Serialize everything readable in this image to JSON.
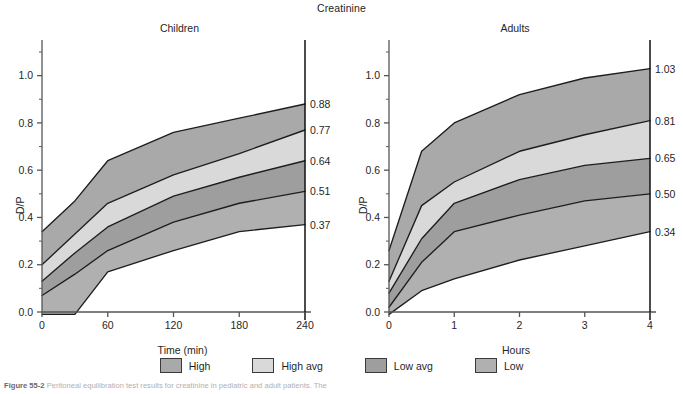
{
  "figure": {
    "title": "Creatinine",
    "caption_prefix": "Figure 55-2",
    "caption_text": "Peritoneal equilibration test results for creatinine in pediatric and adult patients. The"
  },
  "legend": {
    "items": [
      {
        "label": "High",
        "color": "#a9a9a9"
      },
      {
        "label": "High avg",
        "color": "#d9d9d9"
      },
      {
        "label": "Low avg",
        "color": "#9e9e9e"
      },
      {
        "label": "Low",
        "color": "#b0b0b0"
      }
    ]
  },
  "chart_data": [
    {
      "type": "area",
      "title": "Children",
      "xlabel": "Time (min)",
      "ylabel": "D/P",
      "xlim": [
        0,
        240
      ],
      "ylim": [
        -0.02,
        1.1
      ],
      "xticks": [
        0,
        60,
        120,
        180,
        240
      ],
      "xticklabels": [
        "0",
        "60",
        "120",
        "180",
        "240"
      ],
      "yticks": [
        0.0,
        0.2,
        0.4,
        0.6,
        0.8,
        1.0
      ],
      "yticklabels": [
        "0.0",
        "0.2",
        "0.4",
        "0.6",
        "0.8",
        "1.0"
      ],
      "yminorticks": [
        0.1,
        0.3,
        0.5,
        0.7,
        0.9,
        1.1
      ],
      "grid": false,
      "legend_position": "bottom",
      "x": [
        0,
        30,
        60,
        120,
        180,
        240
      ],
      "series": [
        {
          "name": "High boundary",
          "values": [
            0.34,
            0.47,
            0.64,
            0.76,
            0.82,
            0.88
          ]
        },
        {
          "name": "High avg boundary",
          "values": [
            0.2,
            0.33,
            0.46,
            0.58,
            0.67,
            0.77
          ]
        },
        {
          "name": "mid boundary",
          "values": [
            0.13,
            0.25,
            0.36,
            0.49,
            0.57,
            0.64
          ]
        },
        {
          "name": "Low avg boundary",
          "values": [
            0.07,
            0.16,
            0.26,
            0.38,
            0.46,
            0.51
          ]
        },
        {
          "name": "Low boundary",
          "values": [
            -0.01,
            -0.01,
            0.17,
            0.26,
            0.34,
            0.37
          ]
        }
      ],
      "bands": [
        {
          "label": "High",
          "upper": "High boundary",
          "lower": "High avg boundary",
          "color": "#a9a9a9"
        },
        {
          "label": "High avg",
          "upper": "High avg boundary",
          "lower": "mid boundary",
          "color": "#d9d9d9"
        },
        {
          "label": "Low avg",
          "upper": "mid boundary",
          "lower": "Low avg boundary",
          "color": "#9e9e9e"
        },
        {
          "label": "Low",
          "upper": "Low avg boundary",
          "lower": "Low boundary",
          "color": "#b0b0b0"
        }
      ],
      "endpoint_labels": [
        "0.88",
        "0.77",
        "0.64",
        "0.51",
        "0.37"
      ],
      "endpoint_values": [
        0.88,
        0.77,
        0.64,
        0.51,
        0.37
      ]
    },
    {
      "type": "area",
      "title": "Adults",
      "xlabel": "Hours",
      "ylabel": "D/P",
      "xlim": [
        0,
        4
      ],
      "ylim": [
        -0.02,
        1.1
      ],
      "xticks": [
        0,
        1,
        2,
        3,
        4
      ],
      "xticklabels": [
        "0",
        "1",
        "2",
        "3",
        "4"
      ],
      "yticks": [
        0.0,
        0.2,
        0.4,
        0.6,
        0.8,
        1.0
      ],
      "yticklabels": [
        "0.0",
        "0.2",
        "0.4",
        "0.6",
        "0.8",
        "1.0"
      ],
      "yminorticks": [
        0.1,
        0.3,
        0.5,
        0.7,
        0.9,
        1.1
      ],
      "grid": false,
      "legend_position": "bottom",
      "x": [
        0,
        0.5,
        1,
        2,
        3,
        4
      ],
      "series": [
        {
          "name": "High boundary",
          "values": [
            0.26,
            0.68,
            0.8,
            0.92,
            0.99,
            1.03
          ]
        },
        {
          "name": "High avg boundary",
          "values": [
            0.13,
            0.45,
            0.55,
            0.68,
            0.75,
            0.81
          ]
        },
        {
          "name": "mid boundary",
          "values": [
            0.08,
            0.31,
            0.46,
            0.56,
            0.62,
            0.65
          ]
        },
        {
          "name": "Low avg boundary",
          "values": [
            0.02,
            0.21,
            0.34,
            0.41,
            0.47,
            0.5
          ]
        },
        {
          "name": "Low boundary",
          "values": [
            -0.01,
            0.09,
            0.14,
            0.22,
            0.28,
            0.34
          ]
        }
      ],
      "bands": [
        {
          "label": "High",
          "upper": "High boundary",
          "lower": "High avg boundary",
          "color": "#a9a9a9"
        },
        {
          "label": "High avg",
          "upper": "High avg boundary",
          "lower": "mid boundary",
          "color": "#d9d9d9"
        },
        {
          "label": "Low avg",
          "upper": "mid boundary",
          "lower": "Low avg boundary",
          "color": "#9e9e9e"
        },
        {
          "label": "Low",
          "upper": "Low avg boundary",
          "lower": "Low boundary",
          "color": "#b0b0b0"
        }
      ],
      "endpoint_labels": [
        "1.03",
        "0.81",
        "0.65",
        "0.50",
        "0.34"
      ],
      "endpoint_values": [
        1.03,
        0.81,
        0.65,
        0.5,
        0.34
      ]
    }
  ]
}
